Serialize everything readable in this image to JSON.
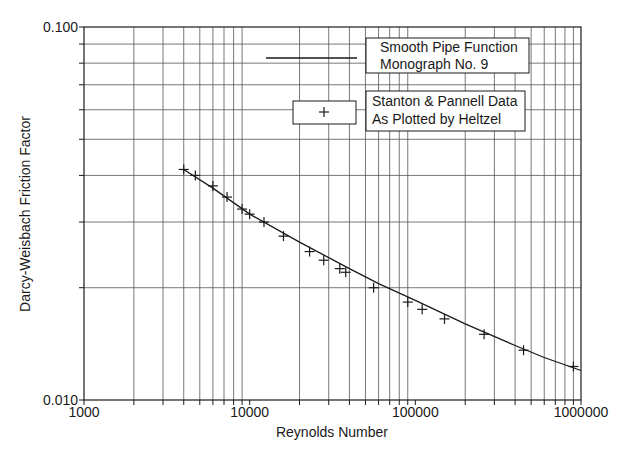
{
  "chart_data": {
    "type": "line",
    "title": "",
    "xlabel": "Reynolds Number",
    "ylabel": "Darcy-Weisbach Friction Factor",
    "xscale": "log",
    "yscale": "log",
    "xlim": [
      1000,
      1000000
    ],
    "ylim": [
      0.01,
      0.1
    ],
    "x_tick_labels": [
      "1000",
      "10000",
      "100000",
      "1000000"
    ],
    "y_tick_labels": [
      "0.010",
      "0.100"
    ],
    "grid": true,
    "legend_position": "upper right",
    "legend": [
      {
        "symbol": "line",
        "lines": [
          "Smooth Pipe Function",
          "Monograph No.  9"
        ]
      },
      {
        "symbol": "plus-marker",
        "lines": [
          "Stanton & Pannell Data",
          "As Plotted by Heltzel"
        ]
      }
    ],
    "series": [
      {
        "name": "Smooth Pipe Function Monograph No. 9",
        "style": "line",
        "x": [
          4000,
          6000,
          10000,
          20000,
          40000,
          60000,
          100000,
          200000,
          400000,
          600000,
          1000000
        ],
        "y": [
          0.0415,
          0.037,
          0.0315,
          0.0265,
          0.0225,
          0.0205,
          0.0185,
          0.016,
          0.014,
          0.013,
          0.012
        ]
      },
      {
        "name": "Stanton & Pannell Data As Plotted by Heltzel",
        "style": "scatter-plus",
        "x": [
          4000,
          4700,
          6000,
          7300,
          9000,
          10000,
          12200,
          16000,
          23000,
          28000,
          35000,
          38000,
          56000,
          90000,
          110000,
          150000,
          260000,
          450000,
          900000
        ],
        "y": [
          0.0415,
          0.04,
          0.0375,
          0.035,
          0.0325,
          0.0315,
          0.03,
          0.0275,
          0.025,
          0.0237,
          0.0225,
          0.022,
          0.02,
          0.0183,
          0.0175,
          0.0165,
          0.015,
          0.0136,
          0.0123
        ]
      }
    ]
  },
  "plot": {
    "left": 84,
    "right": 581,
    "top": 27,
    "bottom": 400,
    "line_color": "#1a1a1a",
    "grid_color": "#555555",
    "background": "#ffffff"
  }
}
